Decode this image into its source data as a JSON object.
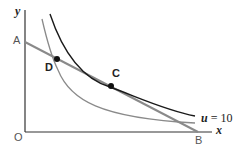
{
  "diagram": {
    "axes": {
      "x_label": "x",
      "y_label": "y",
      "origin_label": "O"
    },
    "points": {
      "A": "A",
      "B": "B",
      "C": "C",
      "D": "D"
    },
    "curves": {
      "outer": {
        "var": "u",
        "eq": "= 10",
        "color": "#1a1a1a"
      },
      "inner": {
        "color": "#888888"
      }
    },
    "budget_line": {
      "from": "A",
      "to": "B",
      "color": "#8a8a8a"
    }
  }
}
